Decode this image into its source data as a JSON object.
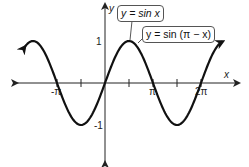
{
  "chart_data": {
    "type": "line",
    "title": "",
    "xlabel": "x",
    "ylabel": "y",
    "x_ticks": [
      {
        "value": -3.14159,
        "label": "-π"
      },
      {
        "value": -1.5708,
        "label": ""
      },
      {
        "value": 1.5708,
        "label": ""
      },
      {
        "value": 3.14159,
        "label": "π"
      },
      {
        "value": 4.71239,
        "label": ""
      },
      {
        "value": 6.28319,
        "label": "2π"
      }
    ],
    "y_ticks": [
      {
        "value": 1,
        "label": "1"
      },
      {
        "value": -1,
        "label": "-1"
      }
    ],
    "xlim": [
      -4.2,
      7.6
    ],
    "ylim": [
      -1.9,
      1.9
    ],
    "grid": false,
    "series": [
      {
        "name": "y = sin x",
        "function": "sin(x)",
        "x_range": [
          -5.2,
          7.7
        ]
      },
      {
        "name": "y = sin (π − x)",
        "function": "sin(pi - x)",
        "x_range": [
          -5.2,
          7.7
        ]
      }
    ],
    "annotations": [
      {
        "text": "y = sin x",
        "points_to": [
          1.5708,
          1
        ]
      },
      {
        "text": "y = sin (π − x)",
        "points_to": [
          1.8,
          0.97
        ]
      }
    ],
    "note": "Both curves coincide (identity sin(π − x) = sin x), drawn as one curve with arrows at both ends."
  },
  "labels": {
    "x_axis": "x",
    "y_axis": "y",
    "tick_neg_pi": "-π",
    "tick_pi": "π",
    "tick_2pi": "2π",
    "tick_y1": "1",
    "tick_ym1": "-1",
    "callout_1": "y = sin x",
    "callout_2": "y = sin (π − x)"
  },
  "colors": {
    "curve": "#111111",
    "axes": "#222222"
  }
}
